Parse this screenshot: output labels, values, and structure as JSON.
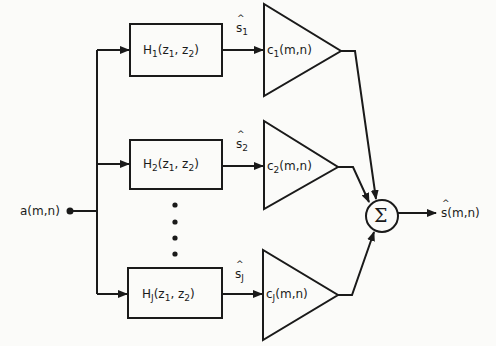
{
  "diagram": {
    "type": "block-diagram",
    "input": {
      "label": "a(m,n)",
      "base": "a",
      "args": "(m,n)"
    },
    "branches": [
      {
        "filter": {
          "base": "H",
          "sub": "1",
          "args_pre": "(z",
          "args_sub1": "1",
          "args_mid": ", z",
          "args_sub2": "2",
          "args_post": ")"
        },
        "signal": {
          "base": "s",
          "sub": "1"
        },
        "gain": {
          "base": "c",
          "sub": "1",
          "args": "(m,n)"
        }
      },
      {
        "filter": {
          "base": "H",
          "sub": "2",
          "args_pre": "(z",
          "args_sub1": "1",
          "args_mid": ", z",
          "args_sub2": "2",
          "args_post": ")"
        },
        "signal": {
          "base": "s",
          "sub": "2"
        },
        "gain": {
          "base": "c",
          "sub": "2",
          "args": "(m,n)"
        }
      },
      {
        "filter": {
          "base": "H",
          "sub": "J",
          "args_pre": "(z",
          "args_sub1": "1",
          "args_mid": ", z",
          "args_sub2": "2",
          "args_post": ")"
        },
        "signal": {
          "base": "s",
          "sub": "J"
        },
        "gain": {
          "base": "c",
          "sub": "J",
          "args": "(m,n)"
        }
      }
    ],
    "summer": {
      "symbol": "Σ"
    },
    "output": {
      "label": "ŝ(m,n)",
      "base": "s",
      "args": "(m,n)"
    },
    "ellipsis": "vertical dots between branch 2 and branch J",
    "colors": {
      "ink": "#1a1a1a",
      "background": "#fbfbf9"
    }
  }
}
